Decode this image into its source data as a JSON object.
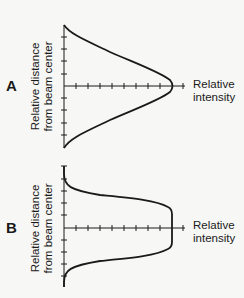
{
  "panels": [
    {
      "letter": "A",
      "ylabel_line1": "Relative distance",
      "ylabel_line2": "from beam center",
      "xlabel_line1": "Relative",
      "xlabel_line2": "intensity",
      "profile": "gaussian"
    },
    {
      "letter": "B",
      "ylabel_line1": "Relative distance",
      "ylabel_line2": "from beam center",
      "xlabel_line1": "Relative",
      "xlabel_line2": "intensity",
      "profile": "flat-top"
    }
  ],
  "colors": {
    "line": "#1a1a1a",
    "background": "#f7f7f5"
  }
}
